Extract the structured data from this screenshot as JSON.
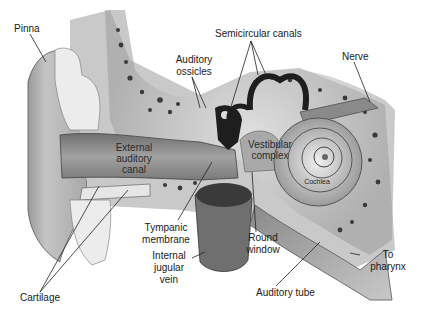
{
  "diagram": {
    "labels": {
      "pinna": "Pinna",
      "auditory_ossicles_1": "Auditory",
      "auditory_ossicles_2": "ossicles",
      "semicircular_canals": "Semicircular canals",
      "nerve": "Nerve",
      "external_canal_1": "External",
      "external_canal_2": "auditory",
      "external_canal_3": "canal",
      "vestibular_1": "Vestibular",
      "vestibular_2": "complex",
      "cochlea": "Cochlea",
      "tympanic_1": "Tympanic",
      "tympanic_2": "membrane",
      "round_window_1": "Round",
      "round_window_2": "window",
      "jugular_1": "Internal",
      "jugular_2": "jugular",
      "jugular_3": "vein",
      "to_pharynx_1": "To",
      "to_pharynx_2": "pharynx",
      "auditory_tube": "Auditory tube",
      "cartilage": "Cartilage"
    },
    "colors": {
      "skin": "#b8b8b8",
      "bone": "#d9d9d9",
      "bone_pores": "#3a3a3a",
      "canal": "#8e8e8e",
      "cartilage": "#e6e6e6",
      "dark": "#1e1e1e",
      "leader": "#222222"
    }
  }
}
